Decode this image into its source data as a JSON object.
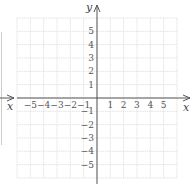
{
  "diagram": {
    "type": "coordinate-plane",
    "x_axis_label": "x",
    "y_axis_label": "y",
    "x_ticks": [
      "−5",
      "−4",
      "−3",
      "−2",
      "−1",
      "1",
      "2",
      "3",
      "4",
      "5"
    ],
    "y_ticks_positive": [
      "5",
      "4",
      "3",
      "2",
      "1"
    ],
    "y_ticks_negative": [
      "−1",
      "−2",
      "−3",
      "−4",
      "−5"
    ],
    "grid_range": [
      -6,
      6
    ],
    "colors": {
      "grid": "#dddddd",
      "axis": "#555555",
      "label": "#555555"
    }
  }
}
